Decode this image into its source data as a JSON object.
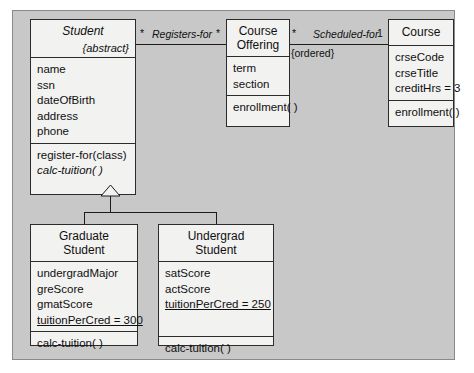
{
  "diagram": {
    "type": "uml-class-diagram",
    "background_color": "#c8c8c8",
    "class_fill_color": "#f2f2f0",
    "line_color": "#1c1c1c"
  },
  "classes": {
    "student": {
      "name": "Student",
      "stereotype": "{abstract}",
      "is_abstract": true,
      "attributes": [
        "name",
        "ssn",
        "dateOfBirth",
        "address",
        "phone"
      ],
      "operations": [
        {
          "label": "register-for(class)",
          "italic": false
        },
        {
          "label": "calc-tuition( )",
          "italic": true
        }
      ]
    },
    "course_offering": {
      "name_line1": "Course",
      "name_line2": "Offering",
      "attributes": [
        "term",
        "section"
      ],
      "operations": [
        {
          "label": "enrollment( )",
          "italic": false
        }
      ]
    },
    "course": {
      "name": "Course",
      "attributes": [
        "crseCode",
        "crseTitle",
        "creditHrs = 3"
      ],
      "operations": [
        {
          "label": "enrollment( )",
          "italic": false
        }
      ]
    },
    "graduate_student": {
      "name_line1": "Graduate",
      "name_line2": "Student",
      "attributes": [
        {
          "label": "undergradMajor",
          "underline": false
        },
        {
          "label": "greScore",
          "underline": false
        },
        {
          "label": "gmatScore",
          "underline": false
        },
        {
          "label": "tuitionPerCred = 300",
          "underline": true
        }
      ],
      "operations": [
        {
          "label": "calc-tuition( )",
          "italic": false
        }
      ]
    },
    "undergrad_student": {
      "name_line1": "Undergrad",
      "name_line2": "Student",
      "attributes": [
        {
          "label": "satScore",
          "underline": false
        },
        {
          "label": "actScore",
          "underline": false
        },
        {
          "label": "tuitionPerCred = 250",
          "underline": true
        }
      ],
      "operations": [
        {
          "label": "calc-tuition( )",
          "italic": false
        }
      ]
    }
  },
  "associations": {
    "registers_for": {
      "label": "Registers-for",
      "source_multiplicity": "*",
      "target_multiplicity": "*"
    },
    "scheduled_for": {
      "label": "Scheduled-for",
      "source_multiplicity": "*",
      "target_multiplicity": "1",
      "constraint": "{ordered}"
    }
  },
  "generalization": {
    "parent": "Student",
    "children": [
      "Graduate Student",
      "Undergrad Student"
    ]
  }
}
